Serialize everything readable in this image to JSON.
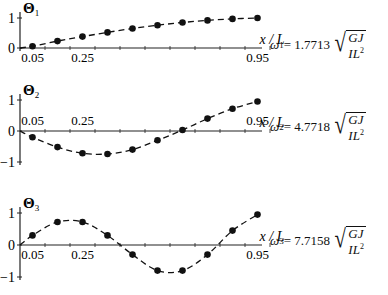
{
  "chart_data": [
    {
      "type": "line",
      "title": "Θ1",
      "xlabel": "x / L",
      "ylabel": "Θ1",
      "x": [
        0.05,
        0.15,
        0.25,
        0.35,
        0.45,
        0.55,
        0.65,
        0.75,
        0.85,
        0.95
      ],
      "series": [
        {
          "name": "Mode 1",
          "values": [
            0.06,
            0.23,
            0.38,
            0.52,
            0.65,
            0.76,
            0.85,
            0.92,
            0.97,
            1.0
          ]
        }
      ],
      "x_tick_labels": [
        "0.05",
        "0.25",
        "0.95"
      ],
      "y_tick_labels": [
        "0",
        "1"
      ],
      "ylim": [
        0,
        1
      ],
      "annotation": "ω1 = 1.7713 √(GJ / IL²)",
      "grid": false
    },
    {
      "type": "line",
      "title": "Θ2",
      "xlabel": "x / L",
      "ylabel": "Θ2",
      "x": [
        0.05,
        0.15,
        0.25,
        0.35,
        0.45,
        0.55,
        0.65,
        0.75,
        0.85,
        0.95
      ],
      "series": [
        {
          "name": "Mode 2",
          "values": [
            -0.2,
            -0.52,
            -0.72,
            -0.74,
            -0.6,
            -0.3,
            0.03,
            0.4,
            0.72,
            0.95
          ]
        }
      ],
      "x_tick_labels": [
        "0.05",
        "0.25",
        "0.95"
      ],
      "y_tick_labels": [
        "-1",
        "0",
        "1"
      ],
      "ylim": [
        -1,
        1
      ],
      "annotation": "ω2 = 4.7718 √(GJ / IL²)",
      "grid": false
    },
    {
      "type": "line",
      "title": "Θ3",
      "xlabel": "x / L",
      "ylabel": "Θ3",
      "x": [
        0.05,
        0.15,
        0.25,
        0.35,
        0.45,
        0.55,
        0.65,
        0.75,
        0.85,
        0.95
      ],
      "series": [
        {
          "name": "Mode 3",
          "values": [
            0.3,
            0.72,
            0.72,
            0.3,
            -0.3,
            -0.8,
            -0.8,
            -0.3,
            0.45,
            0.95
          ]
        }
      ],
      "x_tick_labels": [
        "0.05",
        "0.25",
        "0.95"
      ],
      "y_tick_labels": [
        "-1",
        "0",
        "1"
      ],
      "ylim": [
        -1,
        1
      ],
      "annotation": "ω3 = 7.7158 √(GJ / IL²)",
      "grid": false
    }
  ],
  "plots": [
    {
      "label": "Θ",
      "sub": "1",
      "xlabel": "x / L",
      "omega": "ω",
      "omega_sub": "1",
      "eq": " = 1.7713",
      "num": "GJ",
      "den": "IL",
      "den_sup": "2"
    },
    {
      "label": "Θ",
      "sub": "2",
      "xlabel": "x / L",
      "omega": "ω",
      "omega_sub": "2",
      "eq": " = 4.7718",
      "num": "GJ",
      "den": "IL",
      "den_sup": "2"
    },
    {
      "label": "Θ",
      "sub": "3",
      "xlabel": "x / L",
      "omega": "ω",
      "omega_sub": "3",
      "eq": " = 7.7158",
      "num": "GJ",
      "den": "IL",
      "den_sup": "2"
    }
  ]
}
